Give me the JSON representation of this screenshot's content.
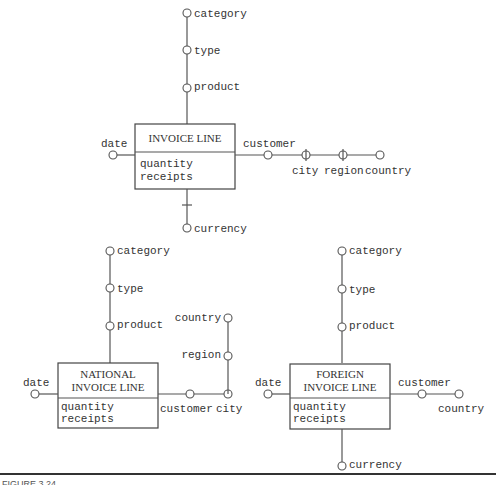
{
  "diagram": {
    "type": "dimensional fact model schemas",
    "schema1": {
      "fact": "INVOICE LINE",
      "measures": [
        "quantity",
        "receipts"
      ],
      "hierarchies": {
        "product": [
          "product",
          "type",
          "category"
        ],
        "date": [
          "date"
        ],
        "customer": [
          "customer",
          "city",
          "region",
          "country"
        ],
        "currency": [
          "currency"
        ]
      }
    },
    "schema2": {
      "fact_line1": "NATIONAL",
      "fact_line2": "INVOICE LINE",
      "measures": [
        "quantity",
        "receipts"
      ],
      "hierarchies": {
        "product": [
          "product",
          "type",
          "category"
        ],
        "date": [
          "date"
        ],
        "customer": [
          "customer",
          "city",
          "region",
          "country"
        ]
      }
    },
    "schema3": {
      "fact_line1": "FOREIGN",
      "fact_line2": "INVOICE LINE",
      "measures": [
        "quantity",
        "receipts"
      ],
      "hierarchies": {
        "product": [
          "product",
          "type",
          "category"
        ],
        "date": [
          "date"
        ],
        "customer": [
          "customer",
          "country"
        ],
        "currency": [
          "currency"
        ]
      }
    }
  },
  "caption": {
    "text": "FIGURE 3.24"
  }
}
